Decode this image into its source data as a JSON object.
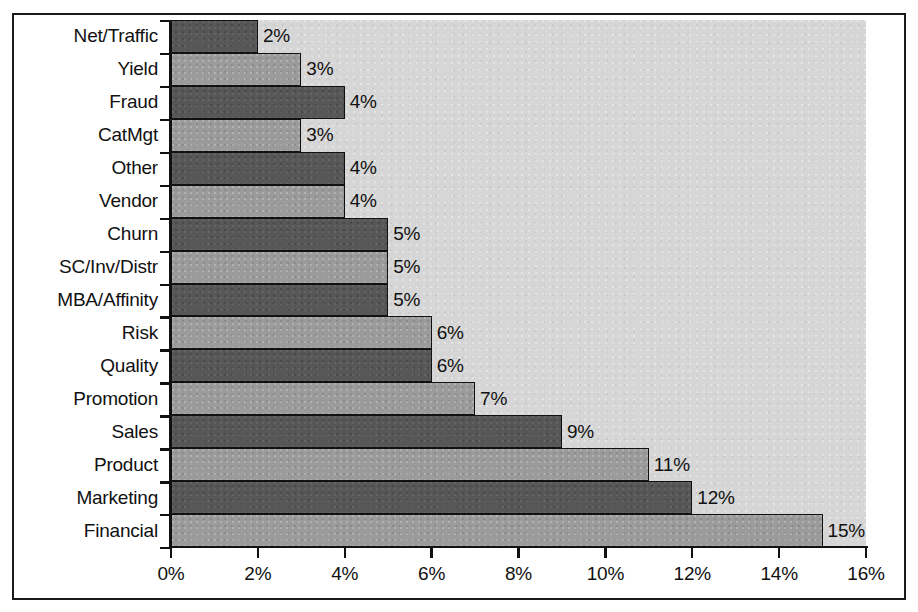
{
  "chart_data": {
    "type": "bar",
    "orientation": "horizontal",
    "title": "",
    "subtitle": "",
    "xlabel": "",
    "ylabel": "",
    "xlim": [
      0,
      16
    ],
    "grid": false,
    "legend": null,
    "value_suffix": "%",
    "categories": [
      "Net/Traffic",
      "Yield",
      "Fraud",
      "CatMgt",
      "Other",
      "Vendor",
      "Churn",
      "SC/Inv/Distr",
      "MBA/Affinity",
      "Risk",
      "Quality",
      "Promotion",
      "Sales",
      "Product",
      "Marketing",
      "Financial"
    ],
    "values": [
      2,
      3,
      4,
      3,
      4,
      4,
      5,
      5,
      5,
      6,
      6,
      7,
      9,
      11,
      12,
      15
    ],
    "data_labels": [
      "2%",
      "3%",
      "4%",
      "3%",
      "4%",
      "4%",
      "5%",
      "5%",
      "5%",
      "6%",
      "6%",
      "7%",
      "9%",
      "11%",
      "12%",
      "15%"
    ],
    "bar_tones": [
      "dark",
      "light",
      "dark",
      "light",
      "dark",
      "light",
      "dark",
      "light",
      "dark",
      "light",
      "dark",
      "light",
      "dark",
      "light",
      "dark",
      "light"
    ],
    "xticks": [
      0,
      2,
      4,
      6,
      8,
      10,
      12,
      14,
      16
    ],
    "xtick_labels": [
      "0%",
      "2%",
      "4%",
      "6%",
      "8%",
      "10%",
      "12%",
      "14%",
      "16%"
    ],
    "colors": {
      "bar_dark": "#575757",
      "bar_light": "#9b9b9b",
      "bar_outline": "#111111",
      "plot_background": "#d6d6d6",
      "figure_background": "#ffffff",
      "axis": "#111111",
      "text": "#111111",
      "frame": "#1a1a1a"
    }
  }
}
